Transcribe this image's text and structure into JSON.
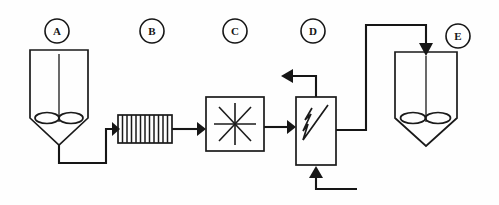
{
  "diagram": {
    "type": "process-flow-diagram",
    "background_color": "#fefefe",
    "line_color": "#161616",
    "canvas": {
      "width": 499,
      "height": 205
    }
  },
  "tags": [
    {
      "id": "A",
      "label": "A",
      "name": "equipment-tag-a",
      "cx": 57,
      "cy": 31,
      "r": 12
    },
    {
      "id": "B",
      "label": "B",
      "name": "equipment-tag-b",
      "cx": 152,
      "cy": 31,
      "r": 12
    },
    {
      "id": "C",
      "label": "C",
      "name": "equipment-tag-c",
      "cx": 235,
      "cy": 31,
      "r": 12
    },
    {
      "id": "D",
      "label": "D",
      "name": "equipment-tag-d",
      "cx": 313,
      "cy": 31,
      "r": 12
    },
    {
      "id": "E",
      "label": "E",
      "name": "equipment-tag-e",
      "cx": 458,
      "cy": 36,
      "r": 12
    }
  ],
  "equipment": [
    {
      "id": "A",
      "name": "stirred-tank-a",
      "symbol": "agitated-vessel-conical-bottom",
      "description": "Agitated vessel with conical bottom and impeller",
      "x": 30,
      "y": 50,
      "width": 58,
      "body_height": 68,
      "cone_depth": 27
    },
    {
      "id": "B",
      "name": "hatched-exchanger-b",
      "symbol": "hatched-rectangle",
      "description": "Rectangular unit with vertical hatch lines",
      "x": 118,
      "y": 115,
      "width": 54,
      "height": 28,
      "hatch_count": 12
    },
    {
      "id": "C",
      "name": "mixer-c",
      "symbol": "square-with-asterisk",
      "description": "Square unit with eight-point star symbol",
      "x": 206,
      "y": 97,
      "width": 58,
      "height": 54
    },
    {
      "id": "D",
      "name": "heat-exchanger-d",
      "symbol": "rectangle-with-zigzag",
      "description": "Tall rectangle containing a zigzag element",
      "x": 296,
      "y": 97,
      "width": 40,
      "height": 68
    },
    {
      "id": "E",
      "name": "stirred-tank-e",
      "symbol": "agitated-vessel-conical-bottom",
      "description": "Agitated vessel with conical bottom and impeller",
      "x": 395,
      "y": 52,
      "width": 62,
      "body_height": 66,
      "cone_depth": 28
    }
  ],
  "streams": [
    {
      "name": "stream-a-to-b",
      "from": "A",
      "to": "B",
      "arrow": "right",
      "route": "down-right-up"
    },
    {
      "name": "stream-b-to-c",
      "from": "B",
      "to": "C",
      "arrow": "right",
      "route": "straight"
    },
    {
      "name": "stream-c-to-d",
      "from": "C",
      "to": "D",
      "arrow": "right",
      "route": "straight"
    },
    {
      "name": "stream-d-overhead-vent",
      "from": "D",
      "to": "vent",
      "arrow": "left",
      "route": "up-left"
    },
    {
      "name": "stream-d-bottom-feed",
      "from": "feed",
      "to": "D",
      "arrow": "up",
      "route": "left-up"
    },
    {
      "name": "stream-d-to-e",
      "from": "D",
      "to": "E",
      "arrow": "down",
      "route": "right-up-right-down"
    }
  ]
}
